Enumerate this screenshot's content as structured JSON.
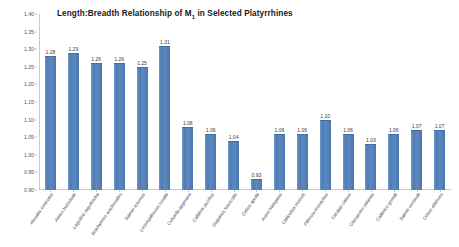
{
  "chart_data": {
    "type": "bar",
    "title": "Length:Breadth Relationship of M1 in Selected Platyrrhines",
    "title_main": "Length:Breadth Relationship of M",
    "title_subscript": "1",
    "title_tail": " in Selected Platyrrhines",
    "xlabel": "",
    "ylabel": "",
    "ylim": [
      0.9,
      1.4
    ],
    "ytick_labels": [
      "1.40",
      "1.35",
      "1.30",
      "1.25",
      "1.20",
      "1.15",
      "1.10",
      "1.05",
      "1.00",
      "0.95",
      "0.90"
    ],
    "ytick_values": [
      1.4,
      1.35,
      1.3,
      1.25,
      1.2,
      1.15,
      1.1,
      1.05,
      1.0,
      0.95,
      0.9
    ],
    "grid": false,
    "legend": "none",
    "bar_color": "#5B87BD",
    "categories": [
      "Alouatta seniculus",
      "Ateles belzebuth",
      "Lagothrix lagothricha",
      "Brachyteles arachnoides",
      "Saimiri sciureus",
      "Leontopithecus rosalia",
      "Cebuella pygmaea",
      "Callithrix jacchus",
      "Saguinus fuscicollis",
      "Cebus apella",
      "Aotus trivirgatus",
      "Callicebus moloch",
      "Pithecia monachus",
      "Cacajao calvus",
      "Chiropotes satanas",
      "Callimico goeldii",
      "Saimiri oerstedii",
      "Cebus albifrons"
    ],
    "values": [
      1.28,
      1.29,
      1.26,
      1.26,
      1.25,
      1.31,
      1.08,
      1.06,
      1.04,
      0.93,
      1.06,
      1.06,
      1.1,
      1.06,
      1.03,
      1.06,
      1.07,
      1.07
    ],
    "value_labels": [
      "1.28",
      "1.29",
      "1.26",
      "1.26",
      "1.25",
      "1.31",
      "1.08",
      "1.06",
      "1.04",
      "0.93",
      "1.06",
      "1.06",
      "1.10",
      "1.06",
      "1.03",
      "1.06",
      "1.07",
      "1.07"
    ]
  }
}
